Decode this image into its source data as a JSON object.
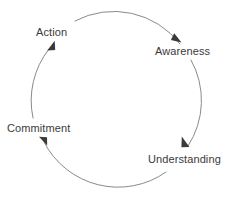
{
  "diagram": {
    "type": "cycle",
    "title": "",
    "background_color": "#ffffff",
    "stroke_color": "#8a8a8a",
    "text_color": "#3a3a3a",
    "arrow_fill": "#3a3a3a",
    "geometry": {
      "center_x": 114.5,
      "center_y": 97,
      "radius": 83,
      "direction": "clockwise"
    },
    "nodes": [
      {
        "id": "action",
        "label": "Action",
        "x": 36,
        "y": 26
      },
      {
        "id": "awareness",
        "label": "Awareness",
        "x": 155,
        "y": 45
      },
      {
        "id": "understanding",
        "label": "Understanding",
        "x": 148,
        "y": 153
      },
      {
        "id": "commitment",
        "label": "Commitment",
        "x": 7,
        "y": 122
      }
    ],
    "edges": [
      {
        "from": "action",
        "to": "awareness",
        "arrowhead_x": 178,
        "arrowhead_y": 40
      },
      {
        "from": "awareness",
        "to": "understanding",
        "arrowhead_x": 187,
        "arrowhead_y": 144
      },
      {
        "from": "understanding",
        "to": "commitment",
        "arrowhead_x": 42,
        "arrowhead_y": 140
      },
      {
        "from": "commitment",
        "to": "action",
        "arrowhead_x": 51,
        "arrowhead_y": 45
      }
    ]
  }
}
